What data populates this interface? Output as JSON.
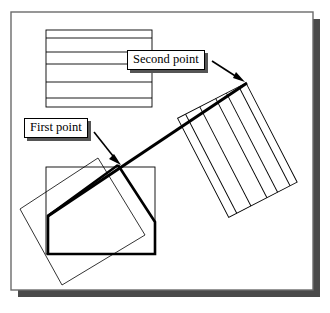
{
  "figure": {
    "background_color": "#ffffff",
    "frame": {
      "name": "drawing-frame",
      "x": 11,
      "y": 12,
      "width": 302,
      "height": 278,
      "border_color": "#6b6b6b",
      "shadow_color": "#4a4a4a",
      "shadow_offset": 7
    },
    "callouts": [
      {
        "id": "second-point",
        "label": "Second point",
        "x": 127,
        "y": 50,
        "arrow_from": [
          213,
          62
        ],
        "arrow_to": [
          243,
          80
        ]
      },
      {
        "id": "first-point",
        "label": "First point",
        "x": 24,
        "y": 118,
        "arrow_from": [
          95,
          133
        ],
        "arrow_to": [
          120,
          160
        ]
      }
    ],
    "shapes": {
      "source_rectangle": {
        "name": "source-striped-rectangle",
        "x": 46,
        "y": 30,
        "width": 106,
        "height": 77,
        "stroke": "#000000",
        "stroke_width": 0.9,
        "internal_lines": 5,
        "line_y_offsets": [
          8,
          22,
          34,
          52,
          68
        ]
      },
      "rotated_rectangle": {
        "name": "rotated-striped-rectangle",
        "corners": [
          [
            246,
            83
          ],
          [
            297,
            182
          ],
          [
            243,
            222
          ],
          [
            192,
            125
          ]
        ],
        "stroke": "#000000",
        "stroke_width": 0.9,
        "internal_lines": 5
      },
      "base_rectangle": {
        "name": "base-rectangle",
        "x": 46,
        "y": 167,
        "width": 109,
        "height": 87,
        "stroke": "#000000",
        "stroke_width": 0.9
      },
      "thin_rotated_rectangle": {
        "name": "thin-rotated-rectangle",
        "corners": [
          [
            98,
            158
          ],
          [
            145,
            235
          ],
          [
            62,
            285
          ],
          [
            20,
            209
          ]
        ],
        "stroke": "#000000",
        "stroke_width": 0.8
      },
      "bold_polygon": {
        "name": "bold-result-polygon",
        "points": [
          [
            118,
            165
          ],
          [
            155,
            222
          ],
          [
            155,
            254
          ],
          [
            48,
            254
          ],
          [
            48,
            216
          ]
        ],
        "stroke": "#000000",
        "stroke_width": 2.6
      },
      "bold_axis_line": {
        "name": "bold-rotation-axis",
        "from": [
          48,
          216
        ],
        "to": [
          246,
          83
        ],
        "stroke": "#000000",
        "stroke_width": 3.0
      }
    },
    "colors": {
      "ink": "#000000",
      "frame_border": "#6b6b6b",
      "shadow": "#4a4a4a",
      "callout_shadow": "#555555",
      "paper": "#ffffff"
    }
  }
}
